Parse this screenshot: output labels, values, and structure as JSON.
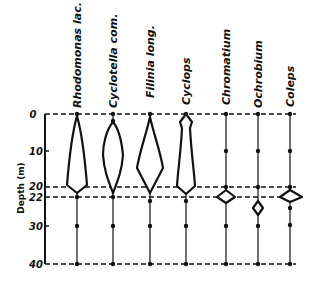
{
  "diagram": {
    "y_axis": {
      "label": "Depth (m)",
      "ticks": [
        {
          "label": "0",
          "depth": 0
        },
        {
          "label": "10",
          "depth": 10
        },
        {
          "label": "20",
          "depth": 20
        },
        {
          "label": "22",
          "depth": 22
        },
        {
          "label": "30",
          "depth": 30
        },
        {
          "label": "40",
          "depth": 40
        }
      ],
      "dashed_lines_at": [
        0,
        20,
        22,
        40
      ]
    },
    "species": [
      {
        "name": "Rhodomonas lac.",
        "distribution": "0-22 m, max near 20 m"
      },
      {
        "name": "Cyclotella com.",
        "distribution": "2-22 m, max near 14 m"
      },
      {
        "name": "Filinia long.",
        "distribution": "0-22 m, max near 15 m"
      },
      {
        "name": "Cyclops",
        "distribution": "0-22 m, max near 19 m"
      },
      {
        "name": "Chromatium",
        "distribution": "20-23 m"
      },
      {
        "name": "Ochrobium",
        "distribution": "22-27 m"
      },
      {
        "name": "Coleps",
        "distribution": "20-24 m"
      }
    ],
    "colors": {
      "ink": "#111111",
      "background": "#ffffff"
    }
  }
}
